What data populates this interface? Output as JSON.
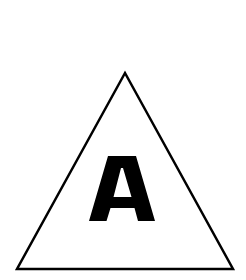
{
  "sign": {
    "shape": "triangle",
    "letter": "A",
    "stroke_color": "#000000",
    "fill_color": "#ffffff",
    "letter_color": "#000000"
  }
}
